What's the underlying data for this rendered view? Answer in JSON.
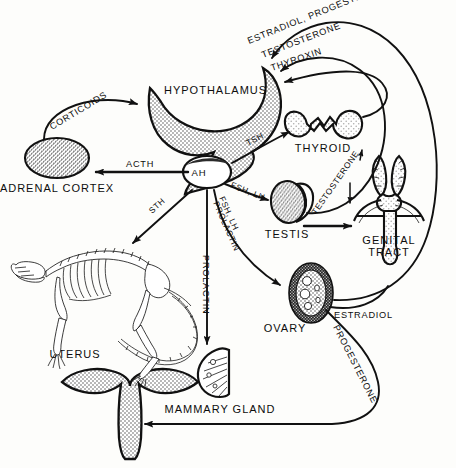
{
  "diagram": {
    "background_color": "#fdfdfb",
    "line_color": "#111111",
    "fill_grey": "#b9b9b9",
    "organs": [
      {
        "id": "hypothalamus",
        "label": "HYPOTHALAMUS",
        "shape": "crescent",
        "fill": "stipple"
      },
      {
        "id": "ah",
        "label": "AH",
        "shape": "oval",
        "fill": "white"
      },
      {
        "id": "adrenal-cortex",
        "label": "ADRENAL CORTEX",
        "shape": "ellipse",
        "fill": "dense-stipple"
      },
      {
        "id": "thyroid",
        "label": "THYROID",
        "shape": "bilobed",
        "fill": "light-stipple"
      },
      {
        "id": "testis",
        "label": "TESTIS",
        "shape": "oval-with-epididymis",
        "fill": "dense-stipple"
      },
      {
        "id": "genital-tract",
        "label": "GENITAL TRACT",
        "label_line_1": "GENITAL",
        "label_line_2": "TRACT",
        "shape": "anatomical",
        "fill": "light-stipple"
      },
      {
        "id": "ovary",
        "label": "OVARY",
        "shape": "oval-follicles",
        "fill": "dark-rim"
      },
      {
        "id": "uterus",
        "label": "UTERUS",
        "shape": "anvil",
        "fill": "stipple"
      },
      {
        "id": "mammary-gland",
        "label": "MAMMARY GLAND",
        "shape": "fan",
        "fill": "white"
      },
      {
        "id": "skeleton",
        "label": "",
        "shape": "rodent-skeleton",
        "fill": "white"
      }
    ],
    "hormone_arrows": [
      {
        "id": "acth",
        "label": "ACTH",
        "from": "ah",
        "to": "adrenal-cortex"
      },
      {
        "id": "tsh",
        "label": "TSH",
        "from": "ah",
        "to": "thyroid"
      },
      {
        "id": "sth",
        "label": "STH",
        "from": "ah",
        "to": "skeleton"
      },
      {
        "id": "fsh-lh-testis",
        "label": "FSH, LH",
        "from": "ah",
        "to": "testis"
      },
      {
        "id": "fsh-lh-ovary",
        "label": "FSH, LH",
        "from": "ah",
        "to": "ovary"
      },
      {
        "id": "prolactin-ovary",
        "label": "PROLACTIN",
        "from": "ah",
        "to": "ovary"
      },
      {
        "id": "prolactin-mammary",
        "label": "PROLACTIN",
        "from": "ah",
        "to": "mammary-gland"
      },
      {
        "id": "corticoids",
        "label": "CORTICOIDS",
        "from": "adrenal-cortex",
        "to": "hypothalamus"
      },
      {
        "id": "thyroxin",
        "label": "THYROXIN",
        "from": "thyroid",
        "to": "hypothalamus"
      },
      {
        "id": "testosterone-feedback",
        "label": "TESTOSTERONE",
        "from": "testis",
        "to": "hypothalamus"
      },
      {
        "id": "estradiol-progesterone-feedback",
        "label": "ESTRADIOL, PROGESTERONE",
        "from": "ovary",
        "to": "hypothalamus"
      },
      {
        "id": "testosterone-genital",
        "label": "TESTOSTERONE",
        "from": "testis",
        "to": "genital-tract"
      },
      {
        "id": "estradiol",
        "label": "ESTRADIOL",
        "from": "ovary",
        "to": "genital-tract"
      },
      {
        "id": "progesterone",
        "label": "PROGESTERONE",
        "from": "ovary",
        "to": "uterus"
      }
    ]
  }
}
